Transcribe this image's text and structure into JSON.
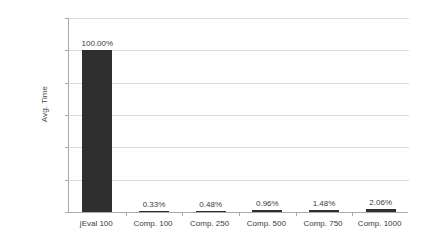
{
  "chart_data": {
    "type": "bar",
    "title": "",
    "xlabel": "",
    "ylabel": "Avg. Time",
    "categories": [
      "jEval 100",
      "Comp. 100",
      "Comp. 250",
      "Comp. 500",
      "Comp. 750",
      "Comp. 1000"
    ],
    "values": [
      100.0,
      0.33,
      0.48,
      0.96,
      1.48,
      2.06
    ],
    "data_labels": [
      "100.00%",
      "0.33%",
      "0.48%",
      "0.96%",
      "1.48%",
      "2.06%"
    ],
    "ylim": [
      0,
      120
    ],
    "ytick_values": [
      0,
      20,
      40,
      60,
      80,
      100,
      120
    ],
    "ytick_labels": [
      "0%",
      "20%",
      "40%",
      "60%",
      "80%",
      "100%",
      "120%"
    ],
    "grid": true,
    "legend": false,
    "legend_position": "none",
    "bar_color": "#2f2f2f",
    "gridline_color": "#dcdcdc",
    "axis_color": "#a9a9a9",
    "background_color": "#ffffff"
  }
}
